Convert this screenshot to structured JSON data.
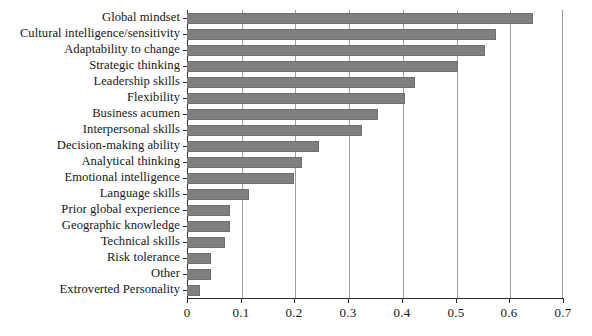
{
  "chart_data": {
    "type": "bar",
    "orientation": "horizontal",
    "title": "",
    "subtitle": "",
    "xlabel": "",
    "ylabel": "",
    "xlim": [
      0,
      0.7
    ],
    "grid": true,
    "legend": null,
    "legend_position": "none",
    "bar_color": "#7f7f7f",
    "axis_color": "#2b2b2b",
    "gridline_color": "#9d9d9d",
    "xticks": [
      "0",
      "0.1",
      "0.2",
      "0.3",
      "0.4",
      "0.5",
      "0.6",
      "0.7"
    ],
    "xtick_values": [
      0,
      0.1,
      0.2,
      0.3,
      0.4,
      0.5,
      0.6,
      0.7
    ],
    "categories": [
      "Global mindset",
      "Cultural intelligence/sensitivity",
      "Adaptability to change",
      "Strategic thinking",
      "Leadership skills",
      "Flexibility",
      "Business acumen",
      "Interpersonal skills",
      "Decision-making ability",
      "Analytical thinking",
      "Emotional intelligence",
      "Language skills",
      "Prior global experience",
      "Geographic knowledge",
      "Technical skills",
      "Risk tolerance",
      "Other",
      "Extroverted Personality"
    ],
    "values": [
      0.645,
      0.575,
      0.555,
      0.505,
      0.425,
      0.405,
      0.355,
      0.325,
      0.245,
      0.215,
      0.2,
      0.115,
      0.08,
      0.08,
      0.07,
      0.045,
      0.045,
      0.025
    ]
  }
}
